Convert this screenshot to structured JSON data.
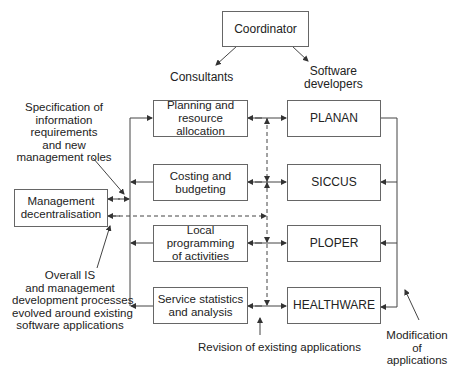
{
  "diagram": {
    "coordinator": "Coordinator",
    "groups": {
      "consultants": "Consultants",
      "software_developers_line1": "Software",
      "software_developers_line2": "developers"
    },
    "management_box": {
      "line1": "Management",
      "line2": "decentralisation"
    },
    "functions": [
      {
        "line1": "Planning and",
        "line2": "resource allocation"
      },
      {
        "line1": "Costing and",
        "line2": "budgeting"
      },
      {
        "line1": "Local programming",
        "line2": "of activities"
      },
      {
        "line1": "Service statistics",
        "line2": "and analysis"
      }
    ],
    "applications": [
      "PLANAN",
      "SICCUS",
      "PLOPER",
      "HEALTHWARE"
    ],
    "annotations": {
      "specification": [
        "Specification of",
        "information",
        "requirements",
        "and new",
        "management roles"
      ],
      "overall": [
        "Overall IS",
        "and management",
        "development processes",
        "evolved around existing",
        "software applications"
      ],
      "revision": "Revision of existing applications",
      "modification": [
        "Modification",
        "of",
        "applications"
      ]
    },
    "colors": {
      "line": "#444444",
      "box_border": "#666666",
      "text": "#222222"
    }
  }
}
